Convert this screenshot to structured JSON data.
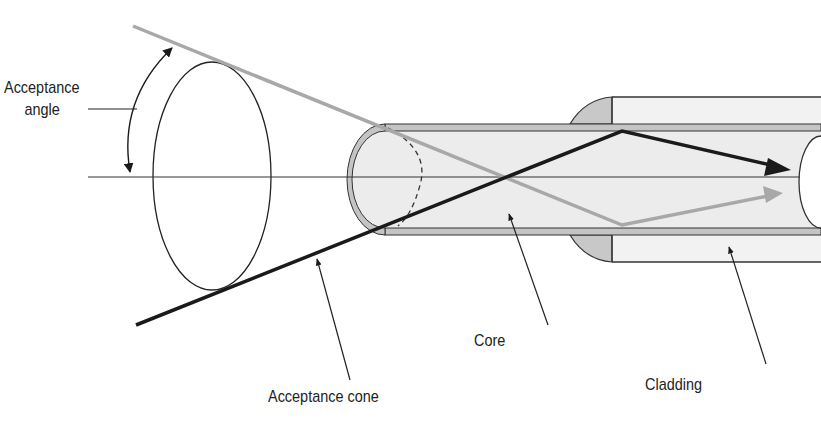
{
  "diagram": {
    "labels": {
      "acceptance_angle_line1": "Acceptance",
      "acceptance_angle_line2": "angle",
      "acceptance_cone": "Acceptance cone",
      "core": "Core",
      "cladding": "Cladding"
    },
    "colors": {
      "background": "#ffffff",
      "line_dark": "#1a1a1a",
      "ray_gray": "#a8a8a8",
      "cladding_fill": "#d2d2d2",
      "core_fill": "#ececec",
      "jacket_fill": "#f2f2f2",
      "jacket_end_fill": "#c8c8c8"
    },
    "components": [
      "acceptance-cone-ellipse",
      "fiber-core",
      "fiber-cladding",
      "fiber-jacket",
      "axis-line",
      "dark-ray",
      "gray-ray",
      "acceptance-angle-arc"
    ]
  }
}
